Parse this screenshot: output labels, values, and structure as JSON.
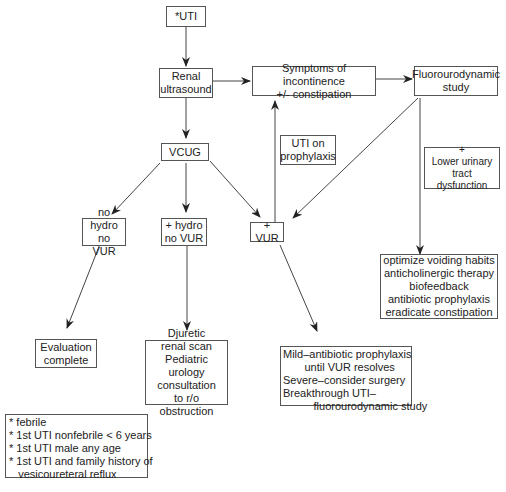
{
  "diagram": {
    "type": "flowchart",
    "nodes": {
      "uti": {
        "label": "*UTI"
      },
      "renal_us": {
        "label": "Renal\nultrasound"
      },
      "symptoms": {
        "label": "Symptoms of incontinence\n+/- constipation"
      },
      "fluoro": {
        "label": "Fluorourodynamic\nstudy"
      },
      "vcug": {
        "label": "VCUG"
      },
      "uti_prophylaxis": {
        "label": "UTI on\nprophylaxis"
      },
      "lutd": {
        "label": "+\nLower urinary\ntract dysfunction"
      },
      "no_hydro": {
        "label": "no hydro\nno VUR"
      },
      "hydro": {
        "label": "+ hydro\nno VUR"
      },
      "vur": {
        "label": "+ VUR"
      },
      "eval_complete": {
        "label": "Evaluation\ncomplete"
      },
      "diuretic": {
        "label": "Djuretic\nrenal scan\nPediatric urology\nconsultation\nto r/o obstruction"
      },
      "vur_mgmt": {
        "lines": [
          "Mild–antibiotic prophylaxis",
          "       until VUR resolves",
          "Severe–consider surgery",
          "Breakthrough UTI–",
          "          fluorourodynamic study"
        ]
      },
      "lutd_mgmt": {
        "label": "optimize voiding habits\nanticholinergic therapy\nbiofeedback\nantibiotic prophylaxis\neradicate constipation"
      },
      "footnote": {
        "lines": [
          "* febrile",
          "* 1st UTI nonfebrile < 6 years",
          "* 1st UTI male any age",
          "* 1st UTI and family history of",
          "   vesicoureteral reflux"
        ]
      }
    },
    "edges": [
      {
        "from": "uti",
        "to": "renal_us"
      },
      {
        "from": "renal_us",
        "to": "symptoms"
      },
      {
        "from": "symptoms",
        "to": "fluoro"
      },
      {
        "from": "renal_us",
        "to": "vcug"
      },
      {
        "from": "vcug",
        "to": "no_hydro"
      },
      {
        "from": "vcug",
        "to": "hydro"
      },
      {
        "from": "vcug",
        "to": "vur"
      },
      {
        "from": "fluoro",
        "to": "vur"
      },
      {
        "from": "vur",
        "to": "symptoms",
        "label": "UTI on prophylaxis"
      },
      {
        "from": "fluoro",
        "to": "lutd_mgmt",
        "label": "+ Lower urinary tract dysfunction"
      },
      {
        "from": "no_hydro",
        "to": "eval_complete"
      },
      {
        "from": "hydro",
        "to": "diuretic"
      },
      {
        "from": "vur",
        "to": "vur_mgmt"
      }
    ],
    "colors": {
      "line": "#444444",
      "border": "#555555",
      "background": "#ffffff"
    }
  }
}
